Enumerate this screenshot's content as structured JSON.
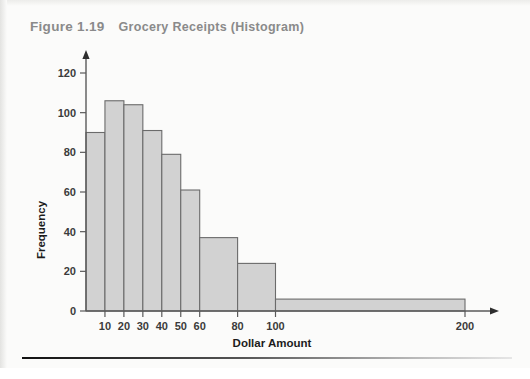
{
  "figure": {
    "number": "Figure 1.19",
    "caption": "Grocery Receipts (Histogram)"
  },
  "chart_data": {
    "type": "bar",
    "title": "Grocery Receipts (Histogram)",
    "xlabel": "Dollar Amount",
    "ylabel": "Frequency",
    "ylim": [
      0,
      120
    ],
    "yticks": [
      0,
      20,
      40,
      60,
      80,
      100,
      120
    ],
    "ytick_labels": [
      "0",
      "20",
      "40",
      "60",
      "80",
      "100",
      "120"
    ],
    "xticks": [
      10,
      20,
      30,
      40,
      50,
      60,
      80,
      100,
      200
    ],
    "xtick_labels": [
      "10",
      "20",
      "30",
      "40",
      "50",
      "60",
      "80",
      "100",
      "200"
    ],
    "grid": false,
    "legend": "none",
    "bin_edges": [
      0,
      10,
      20,
      30,
      40,
      50,
      60,
      80,
      100,
      200
    ],
    "categories": [
      "0-10",
      "10-20",
      "20-30",
      "30-40",
      "40-50",
      "50-60",
      "60-80",
      "80-100",
      "100-200"
    ],
    "values": [
      90,
      106,
      104,
      91,
      79,
      61,
      37,
      24,
      6
    ],
    "bar_fill": "#d2d2d2",
    "bar_stroke": "#6b6b6b",
    "axis_color": "#5a5a5a"
  },
  "axis_labels": {
    "y": "Frequency",
    "x": "Dollar Amount"
  }
}
